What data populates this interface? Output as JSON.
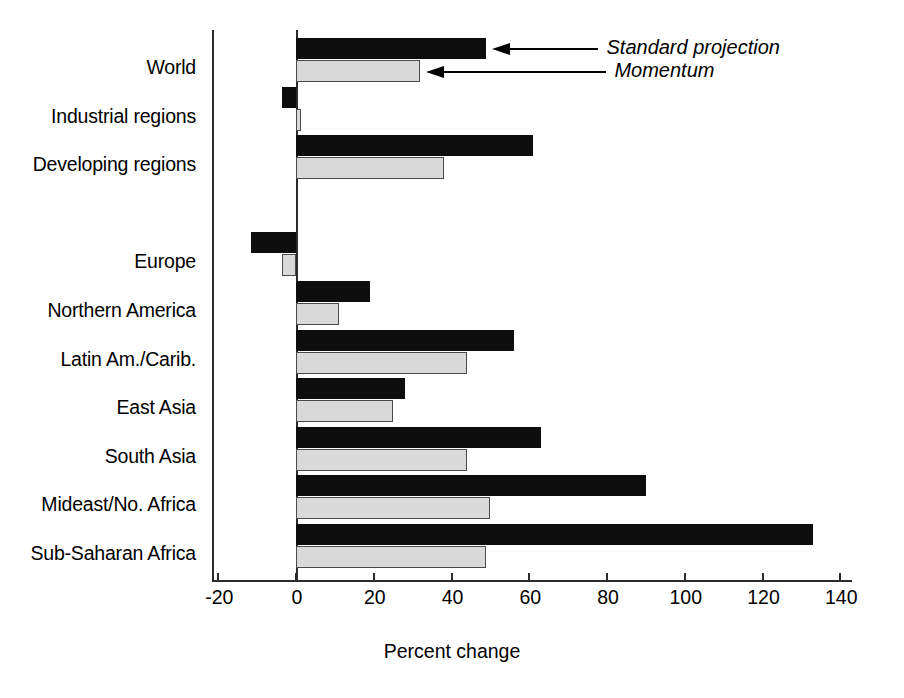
{
  "chart_data": {
    "type": "bar",
    "orientation": "horizontal",
    "title": "",
    "xlabel": "Percent change",
    "ylabel": "",
    "xlim": [
      -20,
      140
    ],
    "xticks": [
      -20,
      0,
      20,
      40,
      60,
      80,
      100,
      120,
      140
    ],
    "xticklabels": [
      "-20",
      "0",
      "20",
      "40",
      "60",
      "80",
      "100",
      "120",
      "140"
    ],
    "grid": false,
    "legend_position": "inline-annotations",
    "categories": [
      "World",
      "Industrial regions",
      "Developing regions",
      "",
      "Europe",
      "Northern America",
      "Latin Am./Carib.",
      "East Asia",
      "South Asia",
      "Mideast/No. Africa",
      "Sub-Saharan Africa"
    ],
    "series": [
      {
        "name": "Standard projection",
        "color": "#0d0d0d",
        "values": [
          49,
          -3.5,
          61,
          null,
          -11.5,
          19,
          56,
          28,
          63,
          90,
          133
        ]
      },
      {
        "name": "Momentum",
        "color": "#d9d9d9",
        "values": [
          32,
          1,
          38,
          null,
          -3.5,
          11,
          44,
          25,
          44,
          50,
          49
        ]
      }
    ],
    "annotations": [
      {
        "label": "Standard projection",
        "target_series": "Standard projection",
        "target_category": "World"
      },
      {
        "label": "Momentum",
        "target_series": "Momentum",
        "target_category": "World"
      }
    ]
  },
  "axis": {
    "x_title": "Percent change"
  }
}
